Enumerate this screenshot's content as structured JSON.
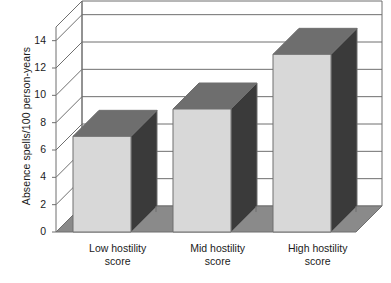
{
  "chart_data": {
    "type": "bar",
    "title": "",
    "subtitle": "",
    "xlabel": "",
    "ylabel": "Absence spells/100 person-years",
    "categories": [
      "Low hostility score",
      "Mid hostility score",
      "High hostility score"
    ],
    "category_lines": [
      [
        "Low hostility",
        "score"
      ],
      [
        "Mid hostility",
        "score"
      ],
      [
        "High hostility",
        "score"
      ]
    ],
    "values": [
      7,
      9,
      13
    ],
    "ylim": [
      0,
      15
    ],
    "yticks": [
      0,
      2,
      4,
      6,
      8,
      10,
      12,
      14
    ],
    "ytick_labels": [
      "0",
      "2",
      "4",
      "6",
      "8",
      "10",
      "12",
      "14"
    ],
    "grid": true,
    "legend": false,
    "legend_position": "none",
    "style": "3d-column",
    "colors": {
      "bar_front": "#d8d8d8",
      "bar_side": "#3a3a3a",
      "bar_top": "#6e6e6e",
      "floor": "#8a8a8a",
      "wall": "#ffffff",
      "grid_line": "#6f6f6f",
      "axis_line": "#6f6f6f",
      "text": "#1b1b1b"
    }
  }
}
